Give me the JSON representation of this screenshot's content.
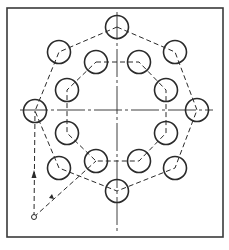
{
  "drawing": {
    "title": "",
    "frame": {
      "x": 7,
      "y": 8,
      "w": 216,
      "h": 229
    },
    "centerlines": {
      "horizontal_y": 110,
      "vertical_x": 117
    },
    "hole_radius": 11.5,
    "outer_holes": [
      {
        "x": 117,
        "y": 27
      },
      {
        "x": 175,
        "y": 52
      },
      {
        "x": 197,
        "y": 110
      },
      {
        "x": 175,
        "y": 168
      },
      {
        "x": 117,
        "y": 191
      },
      {
        "x": 59,
        "y": 168
      },
      {
        "x": 35,
        "y": 111
      },
      {
        "x": 59,
        "y": 52
      }
    ],
    "inner_holes": [
      {
        "x": 96,
        "y": 62
      },
      {
        "x": 139,
        "y": 62
      },
      {
        "x": 166,
        "y": 90
      },
      {
        "x": 166,
        "y": 133
      },
      {
        "x": 139,
        "y": 161
      },
      {
        "x": 96,
        "y": 161
      },
      {
        "x": 67,
        "y": 133
      },
      {
        "x": 67,
        "y": 90
      }
    ],
    "start_point": {
      "x": 34,
      "y": 217
    },
    "colors": {
      "line": "#2a2a2a",
      "frame": "#3a3a3a"
    }
  }
}
